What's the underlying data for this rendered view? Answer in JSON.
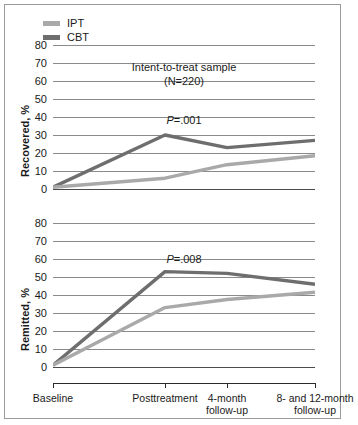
{
  "legend": {
    "items": [
      {
        "label": "IPT",
        "color": "#a9a9a9"
      },
      {
        "label": "CBT",
        "color": "#6e6e6e"
      }
    ]
  },
  "annotations": {
    "sample_title_line1": "Intent-to-treat sample",
    "sample_title_line2": "(N=220)",
    "p_top_prefix": "P",
    "p_top_value": "=.001",
    "p_bottom_prefix": "P",
    "p_bottom_value": "=.008"
  },
  "colors": {
    "ipt": "#a9a9a9",
    "cbt": "#6e6e6e",
    "grid": "#8a8a8a",
    "axis": "#2a2a2a",
    "border": "#9a9a9a",
    "text": "#1a1a1a",
    "background": "#ffffff"
  },
  "chart_data": [
    {
      "type": "line",
      "title": "Intent-to-treat sample (N=220)",
      "xlabel": "",
      "ylabel": "Recovered, %",
      "categories": [
        "Baseline",
        "Posttreatment",
        "4-month follow-up",
        "8- and 12-month follow-up"
      ],
      "ylim": [
        0,
        80
      ],
      "yticks": [
        0,
        10,
        20,
        30,
        40,
        50,
        60,
        70,
        80
      ],
      "grid": true,
      "legend_position": "top-left",
      "annotation": "P=.001",
      "series": [
        {
          "name": "CBT",
          "color": "#6e6e6e",
          "values": [
            1,
            30,
            23,
            27
          ]
        },
        {
          "name": "IPT",
          "color": "#a9a9a9",
          "values": [
            1,
            6,
            13.5,
            18.5
          ]
        }
      ]
    },
    {
      "type": "line",
      "title": "",
      "xlabel": "",
      "ylabel": "Remitted, %",
      "categories": [
        "Baseline",
        "Posttreatment",
        "4-month follow-up",
        "8- and 12-month follow-up"
      ],
      "ylim": [
        0,
        80
      ],
      "yticks": [
        0,
        10,
        20,
        30,
        40,
        50,
        60,
        70,
        80
      ],
      "grid": true,
      "legend_position": "top-left",
      "annotation": "P=.008",
      "series": [
        {
          "name": "CBT",
          "color": "#6e6e6e",
          "values": [
            1,
            53,
            52,
            46
          ]
        },
        {
          "name": "IPT",
          "color": "#a9a9a9",
          "values": [
            1,
            33,
            37.5,
            41.5
          ]
        }
      ]
    }
  ],
  "xaxis": {
    "labels": [
      {
        "line1": "Baseline",
        "line2": ""
      },
      {
        "line1": "Posttreatment",
        "line2": ""
      },
      {
        "line1": "4-month",
        "line2": "follow-up"
      },
      {
        "line1": "8- and 12-month",
        "line2": "follow-up"
      }
    ]
  }
}
